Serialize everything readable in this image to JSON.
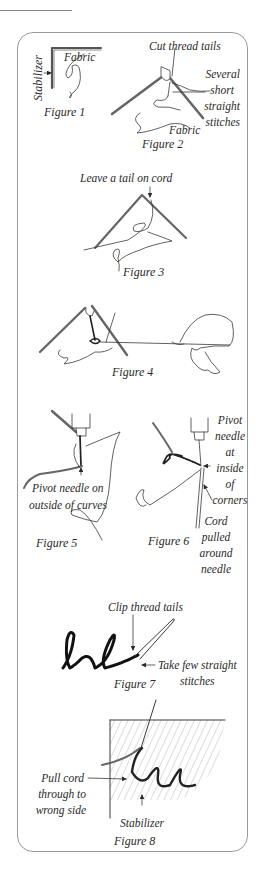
{
  "page": {
    "top_rule": true,
    "panel_border_color": "#9a9a9a",
    "ink_color": "#2a2a2a"
  },
  "figures": [
    {
      "id": 1,
      "caption": "Figure 1",
      "labels": {
        "stabilizer": "Stabilizer",
        "fabric": "Fabric"
      }
    },
    {
      "id": 2,
      "caption": "Figure 2",
      "labels": {
        "cut_tails": "Cut thread tails",
        "stitches_1": "Several",
        "stitches_2": "short",
        "stitches_3": "straight",
        "stitches_4": "stitches",
        "fabric": "Fabric"
      }
    },
    {
      "id": 3,
      "caption": "Figure 3",
      "labels": {
        "leave_tail": "Leave a tail on cord"
      }
    },
    {
      "id": 4,
      "caption": "Figure 4",
      "labels": {}
    },
    {
      "id": 5,
      "caption": "Figure 5",
      "labels": {
        "pivot_1": "Pivot needle on",
        "pivot_2": "outside of curves"
      }
    },
    {
      "id": 6,
      "caption": "Figure 6",
      "labels": {
        "pivot_1": "Pivot",
        "pivot_2": "needle",
        "pivot_3": "at",
        "pivot_4": "inside",
        "pivot_5": "of",
        "pivot_6": "corners",
        "cord_1": "Cord",
        "cord_2": "pulled",
        "cord_3": "around",
        "cord_4": "needle"
      }
    },
    {
      "id": 7,
      "caption": "Figure 7",
      "labels": {
        "clip": "Clip thread tails",
        "take_1": "Take few straight",
        "take_2": "stitches"
      }
    },
    {
      "id": 8,
      "caption": "Figure 8",
      "labels": {
        "pull_1": "Pull cord",
        "pull_2": "through to",
        "pull_3": "wrong side",
        "stabilizer": "Stabilizer"
      }
    }
  ]
}
